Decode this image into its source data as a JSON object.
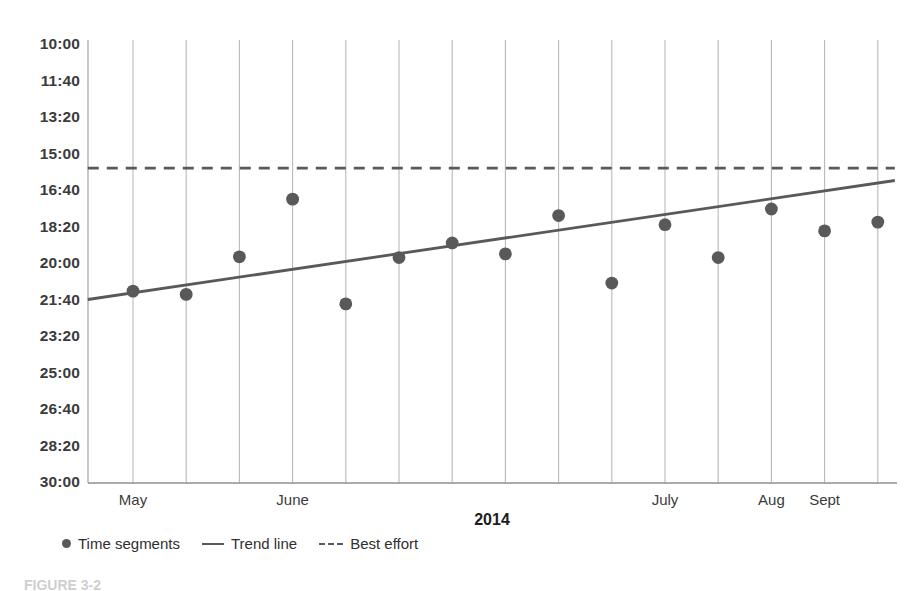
{
  "chart_data": {
    "type": "scatter",
    "title": "",
    "xlabel": "2014",
    "ylabel": "",
    "grid": "vertical",
    "legend_position": "bottom-left",
    "y_inverted": true,
    "y_ticks": [
      "10:00",
      "11:40",
      "13:20",
      "15:00",
      "16:40",
      "18:20",
      "20:00",
      "21:40",
      "23:20",
      "25:00",
      "26:40",
      "28:20",
      "30:00"
    ],
    "y_tick_minutes": [
      600,
      700,
      800,
      900,
      1000,
      1100,
      1200,
      1300,
      1400,
      1500,
      1600,
      1700,
      1800
    ],
    "ylim_minutes": [
      600,
      1800
    ],
    "x_ticks": [
      "May",
      "June",
      "July",
      "Aug",
      "Sept"
    ],
    "x_tick_index": [
      0,
      3,
      10,
      12,
      13
    ],
    "x_gridline_count": 15,
    "series": [
      {
        "name": "Time segments",
        "type": "scatter",
        "color": "#595959",
        "x_index": [
          0,
          1,
          2,
          3,
          4,
          5,
          6,
          7,
          8,
          9,
          10,
          11,
          12,
          13,
          14
        ],
        "values": [
          "21:17",
          "21:26",
          "19:43",
          "17:05",
          "21:52",
          "19:45",
          "19:05",
          "19:35",
          "17:50",
          "20:55",
          "18:15",
          "19:45",
          "17:32",
          "18:32",
          "18:08"
        ],
        "values_minutes": [
          1277,
          1286,
          1183,
          1025,
          1312,
          1185,
          1145,
          1175,
          1070,
          1255,
          1095,
          1185,
          1052,
          1112,
          1088
        ]
      },
      {
        "name": "Trend line",
        "type": "line",
        "style": "solid",
        "color": "#595959",
        "x_endpoints": [
          -0.85,
          14.32
        ],
        "values": [
          "21:40",
          "16:14"
        ],
        "values_minutes": [
          1300,
          974
        ]
      },
      {
        "name": "Best effort",
        "type": "line",
        "style": "dashed",
        "color": "#595959",
        "x_endpoints": [
          -0.85,
          14.32
        ],
        "values": [
          "15:40",
          "15:40"
        ],
        "values_minutes": [
          940,
          940
        ]
      }
    ]
  },
  "axis": {
    "x_title": "2014"
  },
  "legend": {
    "items": [
      {
        "label": "Time segments",
        "marker": "dot"
      },
      {
        "label": "Trend line",
        "marker": "solid-line"
      },
      {
        "label": "Best effort",
        "marker": "dashed-line"
      }
    ]
  },
  "caption": {
    "text": "FIGURE 3-2"
  },
  "colors": {
    "marker": "#595959",
    "trend_line": "#5a5a5a",
    "best_effort_line": "#5a5a5a",
    "gridline": "#b9b9b9",
    "axis": "#9a9a9a",
    "text": "#3b3b3b"
  }
}
